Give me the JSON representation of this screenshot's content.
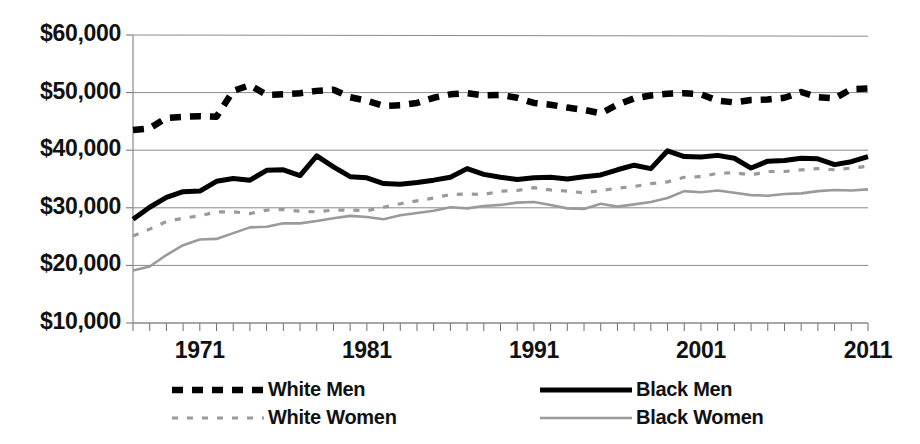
{
  "chart_data": {
    "type": "line",
    "title": "",
    "subtitle": "",
    "xlabel": "",
    "ylabel": "",
    "xlim": [
      1967,
      2011
    ],
    "ylim": [
      10000,
      60000
    ],
    "grid": true,
    "legend_position": "bottom",
    "y_ticks": [
      "$10,000",
      "$20,000",
      "$30,000",
      "$40,000",
      "$50,000",
      "$60,000"
    ],
    "y_tick_values": [
      10000,
      20000,
      30000,
      40000,
      50000,
      60000
    ],
    "x_ticks": [
      "1971",
      "1981",
      "1991",
      "2001",
      "2011"
    ],
    "x_tick_values": [
      1971,
      1981,
      1991,
      2001,
      2011
    ],
    "x": [
      1967,
      1968,
      1969,
      1970,
      1971,
      1972,
      1973,
      1974,
      1975,
      1976,
      1977,
      1978,
      1979,
      1980,
      1981,
      1982,
      1983,
      1984,
      1985,
      1986,
      1987,
      1988,
      1989,
      1990,
      1991,
      1992,
      1993,
      1994,
      1995,
      1996,
      1997,
      1998,
      1999,
      2000,
      2001,
      2002,
      2003,
      2004,
      2005,
      2006,
      2007,
      2008,
      2009,
      2010,
      2011
    ],
    "series": [
      {
        "name": "White Men",
        "style": "thick-dashed",
        "color": "#000000",
        "values": [
          43500,
          43800,
          45600,
          45800,
          45900,
          45800,
          50300,
          51300,
          49600,
          49700,
          49900,
          50300,
          50500,
          49200,
          48600,
          47700,
          47800,
          48200,
          49100,
          49700,
          49900,
          49500,
          49600,
          49100,
          48200,
          47900,
          47400,
          47000,
          46400,
          47900,
          49000,
          49500,
          49800,
          49900,
          49700,
          48600,
          48300,
          48700,
          48800,
          49100,
          50100,
          49200,
          49000,
          50600,
          50700
        ]
      },
      {
        "name": "Black Men",
        "style": "thick-solid",
        "color": "#000000",
        "values": [
          28000,
          30100,
          31800,
          32800,
          32900,
          34600,
          35100,
          34800,
          36500,
          36600,
          35600,
          39000,
          37100,
          35400,
          35200,
          34200,
          34100,
          34400,
          34800,
          35300,
          36800,
          35800,
          35300,
          34900,
          35200,
          35300,
          35000,
          35400,
          35700,
          36600,
          37400,
          36800,
          39900,
          38900,
          38800,
          39100,
          38600,
          36900,
          38100,
          38200,
          38600,
          38500,
          37500,
          38000,
          38900
        ]
      },
      {
        "name": "White Women",
        "style": "light-dashed",
        "color": "#9a9a9a",
        "values": [
          25100,
          26300,
          27600,
          28200,
          28600,
          29300,
          29300,
          29000,
          29600,
          29700,
          29400,
          29300,
          29600,
          29600,
          29500,
          30100,
          30700,
          31200,
          31700,
          32300,
          32400,
          32300,
          32900,
          33000,
          33500,
          33100,
          32900,
          32600,
          33000,
          33400,
          33700,
          34200,
          34500,
          35300,
          35400,
          36000,
          36100,
          35700,
          36300,
          36300,
          36600,
          36800,
          36600,
          36900,
          37200
        ]
      },
      {
        "name": "Black Women",
        "style": "light-solid",
        "color": "#9a9a9a",
        "values": [
          19100,
          19800,
          21800,
          23500,
          24500,
          24600,
          25600,
          26600,
          26700,
          27300,
          27300,
          27700,
          28200,
          28600,
          28400,
          28000,
          28700,
          29100,
          29500,
          30100,
          29900,
          30300,
          30500,
          30900,
          31000,
          30500,
          29900,
          29800,
          30700,
          30200,
          30600,
          31000,
          31700,
          32900,
          32700,
          33000,
          32600,
          32200,
          32100,
          32400,
          32500,
          32900,
          33100,
          33000,
          33200
        ]
      }
    ]
  },
  "legend": {
    "entries": [
      {
        "label": "White Men",
        "style": "thick-dashed",
        "color": "#000000"
      },
      {
        "label": "Black Men",
        "style": "thick-solid",
        "color": "#000000"
      },
      {
        "label": "White Women",
        "style": "light-dashed",
        "color": "#9a9a9a"
      },
      {
        "label": "Black Women",
        "style": "light-solid",
        "color": "#9a9a9a"
      }
    ]
  }
}
